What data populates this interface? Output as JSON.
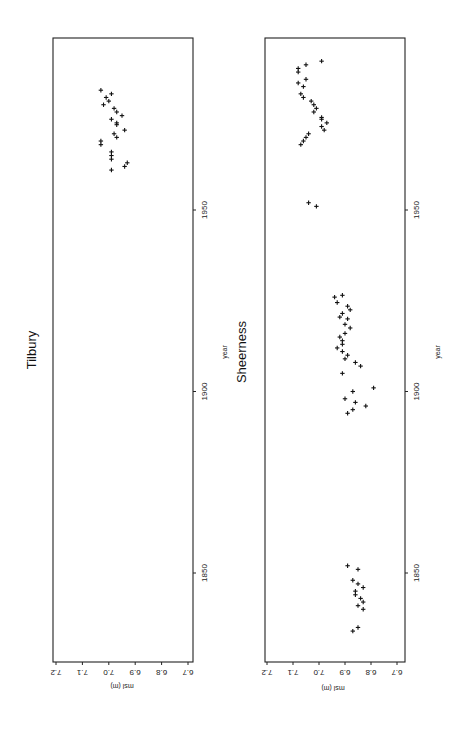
{
  "figure": {
    "panels": [
      {
        "id": "tilbury",
        "title": "Tilbury",
        "xlabel": "year",
        "ylabel": "msl (m)"
      },
      {
        "id": "sheerness",
        "title": "Sheerness",
        "xlabel": "year",
        "ylabel": "msl (m)"
      }
    ],
    "year_ticks": [
      "1850",
      "1900",
      "1950"
    ],
    "msl_ticks": [
      "6.7",
      "6.8",
      "6.9",
      "7.0",
      "7.1",
      "7.2"
    ],
    "orientation": "rotated 90 degrees clockwise (year axis vertical, msl axis horizontal, text reads bottom-to-top)"
  },
  "chart_data": [
    {
      "type": "scatter",
      "title": "Tilbury",
      "xlabel": "year",
      "ylabel": "msl (m)",
      "xlim": [
        1825,
        1997
      ],
      "ylim": [
        6.7,
        7.2
      ],
      "xticks": [
        1850,
        1900,
        1950
      ],
      "yticks": [
        6.7,
        6.8,
        6.9,
        7.0,
        7.1,
        7.2
      ],
      "marker": "+",
      "grid": false,
      "points": [
        [
          1961,
          6.99
        ],
        [
          1962,
          6.94
        ],
        [
          1963,
          6.93
        ],
        [
          1964,
          6.99
        ],
        [
          1965,
          6.99
        ],
        [
          1966,
          6.99
        ],
        [
          1968,
          7.03
        ],
        [
          1969,
          7.03
        ],
        [
          1970,
          6.97
        ],
        [
          1971,
          6.98
        ],
        [
          1972,
          6.94
        ],
        [
          1973.5,
          6.97
        ],
        [
          1974,
          6.97
        ],
        [
          1975,
          6.99
        ],
        [
          1976,
          6.95
        ],
        [
          1977,
          6.97
        ],
        [
          1978,
          6.98
        ],
        [
          1979,
          7.02
        ],
        [
          1980,
          7.0
        ],
        [
          1981,
          7.01
        ],
        [
          1982,
          6.99
        ],
        [
          1983,
          7.03
        ]
      ]
    },
    {
      "type": "scatter",
      "title": "Sheerness",
      "xlabel": "year",
      "ylabel": "msl (m)",
      "xlim": [
        1825,
        1997
      ],
      "ylim": [
        6.7,
        7.2
      ],
      "xticks": [
        1850,
        1900,
        1950
      ],
      "yticks": [
        6.7,
        6.8,
        6.9,
        7.0,
        7.1,
        7.2
      ],
      "marker": "+",
      "grid": false,
      "points": [
        [
          1834,
          6.87
        ],
        [
          1835,
          6.85
        ],
        [
          1840,
          6.83
        ],
        [
          1841,
          6.85
        ],
        [
          1842,
          6.83
        ],
        [
          1843,
          6.84
        ],
        [
          1844,
          6.86
        ],
        [
          1845,
          6.86
        ],
        [
          1846,
          6.83
        ],
        [
          1847,
          6.85
        ],
        [
          1848,
          6.87
        ],
        [
          1851,
          6.85
        ],
        [
          1852,
          6.89
        ],
        [
          1894,
          6.89
        ],
        [
          1895,
          6.87
        ],
        [
          1896,
          6.82
        ],
        [
          1897,
          6.86
        ],
        [
          1898,
          6.9
        ],
        [
          1900,
          6.87
        ],
        [
          1901,
          6.79
        ],
        [
          1905,
          6.91
        ],
        [
          1907,
          6.84
        ],
        [
          1908,
          6.86
        ],
        [
          1909,
          6.9
        ],
        [
          1910,
          6.89
        ],
        [
          1911,
          6.91
        ],
        [
          1912,
          6.93
        ],
        [
          1913,
          6.91
        ],
        [
          1914,
          6.91
        ],
        [
          1915,
          6.92
        ],
        [
          1916,
          6.9
        ],
        [
          1917.5,
          6.88
        ],
        [
          1918.5,
          6.9
        ],
        [
          1920,
          6.89
        ],
        [
          1920.5,
          6.92
        ],
        [
          1921.5,
          6.91
        ],
        [
          1922.5,
          6.88
        ],
        [
          1923.5,
          6.89
        ],
        [
          1924.5,
          6.93
        ],
        [
          1926,
          6.94
        ],
        [
          1926.5,
          6.91
        ],
        [
          1951,
          7.01
        ],
        [
          1952,
          7.04
        ],
        [
          1968,
          7.07
        ],
        [
          1969,
          7.06
        ],
        [
          1970,
          7.05
        ],
        [
          1971,
          7.04
        ],
        [
          1972,
          6.98
        ],
        [
          1973,
          6.99
        ],
        [
          1974,
          6.97
        ],
        [
          1975,
          6.99
        ],
        [
          1975.5,
          6.99
        ],
        [
          1977,
          7.02
        ],
        [
          1978,
          7.01
        ],
        [
          1979,
          7.02
        ],
        [
          1980,
          7.03
        ],
        [
          1981,
          7.06
        ],
        [
          1982,
          7.07
        ],
        [
          1984,
          7.06
        ],
        [
          1985,
          7.08
        ],
        [
          1986,
          7.05
        ],
        [
          1988,
          7.08
        ],
        [
          1989,
          7.08
        ],
        [
          1990,
          7.05
        ],
        [
          1991,
          6.99
        ]
      ]
    }
  ]
}
